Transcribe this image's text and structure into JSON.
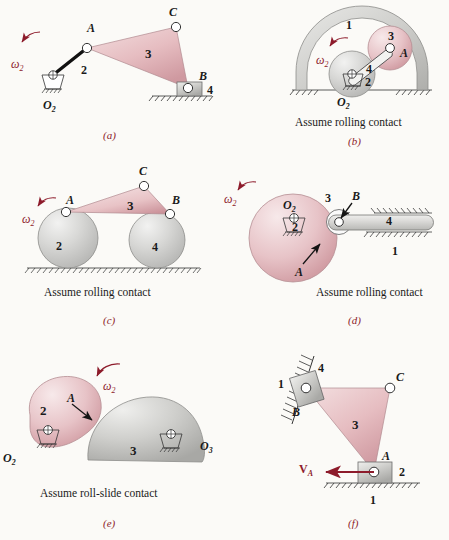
{
  "figure": {
    "background_color": "#fbfaf7",
    "accent_color": "#8d1b2b",
    "pink_body_color": "#e6bcc0",
    "gray_body_color": "#c9c9c9"
  },
  "panels": [
    {
      "id": "a",
      "caption": "(a)",
      "note": "",
      "omega_label": "ω",
      "omega_sub": "2",
      "points": [
        "A",
        "C",
        "B"
      ],
      "ground_point": "O",
      "ground_sub": "2",
      "links": [
        "2",
        "3",
        "4"
      ]
    },
    {
      "id": "b",
      "caption": "(b)",
      "note": "Assume rolling contact",
      "omega_label": "ω",
      "omega_sub": "2",
      "points": [
        "A"
      ],
      "ground_point": "O",
      "ground_sub": "2",
      "links": [
        "1",
        "2",
        "3",
        "4"
      ]
    },
    {
      "id": "c",
      "caption": "(c)",
      "note": "Assume rolling contact",
      "omega_label": "ω",
      "omega_sub": "2",
      "points": [
        "A",
        "B",
        "C"
      ],
      "ground_point": "",
      "ground_sub": "",
      "links": [
        "2",
        "3",
        "4"
      ]
    },
    {
      "id": "d",
      "caption": "(d)",
      "note": "Assume rolling contact",
      "omega_label": "ω",
      "omega_sub": "2",
      "points": [
        "A",
        "B"
      ],
      "ground_point": "O",
      "ground_sub": "2",
      "links": [
        "1",
        "2",
        "3",
        "4"
      ]
    },
    {
      "id": "e",
      "caption": "(e)",
      "note": "Assume roll-slide contact",
      "omega_label": "ω",
      "omega_sub": "2",
      "points": [
        "A"
      ],
      "ground_point": "O",
      "ground_sub": "2",
      "ground_point2": "O",
      "ground_sub2": "3",
      "links": [
        "2",
        "3"
      ]
    },
    {
      "id": "f",
      "caption": "(f)",
      "note": "",
      "vector_label": "V",
      "vector_sub": "A",
      "points": [
        "A",
        "B",
        "C"
      ],
      "links": [
        "1",
        "2",
        "3",
        "4"
      ]
    }
  ],
  "labels": {
    "a": {
      "A": "A",
      "B": "B",
      "C": "C",
      "O2": "O",
      "O2sub": "2",
      "n2": "2",
      "n3": "3",
      "n4": "4",
      "omega": "ω",
      "omega_sub": "2",
      "caption": "(a)"
    },
    "b": {
      "A": "A",
      "O2": "O",
      "O2sub": "2",
      "n1": "1",
      "n2": "2",
      "n3": "3",
      "n4": "4",
      "omega": "ω",
      "omega_sub": "2",
      "note": "Assume rolling contact",
      "caption": "(b)"
    },
    "c": {
      "A": "A",
      "B": "B",
      "C": "C",
      "n2": "2",
      "n3": "3",
      "n4": "4",
      "omega": "ω",
      "omega_sub": "2",
      "note": "Assume rolling contact",
      "caption": "(c)"
    },
    "d": {
      "A": "A",
      "B": "B",
      "O2": "O",
      "O2sub": "2",
      "n1": "1",
      "n2": "2",
      "n3": "3",
      "n4": "4",
      "omega": "ω",
      "omega_sub": "2",
      "note": "Assume rolling contact",
      "caption": "(d)"
    },
    "e": {
      "A": "A",
      "O2": "O",
      "O2sub": "2",
      "O3": "O",
      "O3sub": "3",
      "n2": "2",
      "n3": "3",
      "omega": "ω",
      "omega_sub": "2",
      "note": "Assume roll-slide contact",
      "caption": "(e)"
    },
    "f": {
      "A": "A",
      "B": "B",
      "C": "C",
      "n1": "1",
      "n1b": "1",
      "n2": "2",
      "n3": "3",
      "n4": "4",
      "V": "V",
      "Vsub": "A",
      "caption": "(f)"
    }
  }
}
